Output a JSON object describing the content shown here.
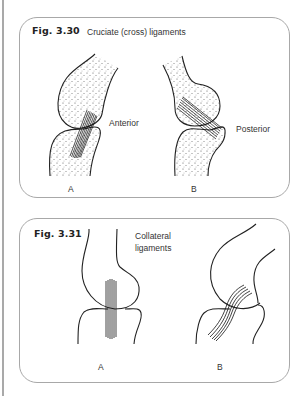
{
  "figures": [
    {
      "number": "Fig. 3.30",
      "title": "Cruciate (cross) ligaments",
      "panels": [
        {
          "letter": "A",
          "label": "Anterior"
        },
        {
          "letter": "B",
          "label": "Posterior"
        }
      ]
    },
    {
      "number": "Fig. 3.31",
      "title_line1": "Collateral",
      "title_line2": "ligaments",
      "panels": [
        {
          "letter": "A"
        },
        {
          "letter": "B"
        }
      ]
    }
  ],
  "colors": {
    "border": "#a8a8a8",
    "ink": "#222222",
    "margin_bar": "#a9a9a9"
  }
}
